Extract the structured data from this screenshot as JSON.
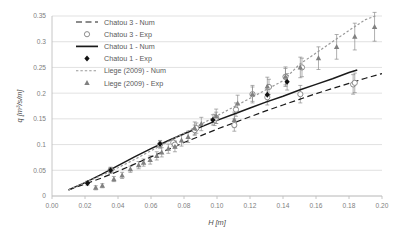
{
  "chart_data": {
    "type": "scatter",
    "title": "",
    "xlabel": "H [m]",
    "ylabel": "q [m³/s/m]",
    "xlim": [
      0.0,
      0.2
    ],
    "ylim": [
      0.0,
      0.35
    ],
    "xticks": [
      "0.00",
      "0.02",
      "0.04",
      "0.06",
      "0.08",
      "0.10",
      "0.12",
      "0.14",
      "0.16",
      "0.18",
      "0.20"
    ],
    "xtick_values": [
      0.0,
      0.02,
      0.04,
      0.06,
      0.08,
      0.1,
      0.12,
      0.14,
      0.16,
      0.18,
      0.2
    ],
    "yticks": [
      "0",
      "0.05",
      "0.1",
      "0.15",
      "0.2",
      "0.25",
      "0.3",
      "0.35"
    ],
    "ytick_values": [
      0,
      0.05,
      0.1,
      0.15,
      0.2,
      0.25,
      0.3,
      0.35
    ],
    "grid": "horizontal",
    "legend_position": "top-left-inside",
    "series": [
      {
        "name": "Chatou 3 - Num",
        "kind": "line",
        "style": "dashed",
        "color": "#1a1a1a",
        "x": [
          0.01,
          0.02,
          0.03,
          0.04,
          0.05,
          0.06,
          0.07,
          0.08,
          0.09,
          0.1,
          0.11,
          0.12,
          0.13,
          0.14,
          0.15,
          0.16,
          0.17,
          0.18,
          0.19,
          0.2
        ],
        "y": [
          0.012,
          0.023,
          0.035,
          0.048,
          0.062,
          0.076,
          0.09,
          0.104,
          0.117,
          0.13,
          0.142,
          0.154,
          0.166,
          0.177,
          0.188,
          0.199,
          0.209,
          0.219,
          0.229,
          0.238
        ]
      },
      {
        "name": "Chatou 3 - Exp",
        "kind": "marker",
        "marker": "open-circle",
        "color": "#808080",
        "x": [
          0.0355,
          0.0655,
          0.0735,
          0.0745,
          0.0865,
          0.0875,
          0.0985,
          0.0995,
          0.1105,
          0.1115,
          0.1215,
          0.1305,
          0.1315,
          0.1415,
          0.1505,
          0.1515,
          0.1825,
          0.1835
        ],
        "y": [
          0.05,
          0.1,
          0.104,
          0.1,
          0.128,
          0.132,
          0.148,
          0.152,
          0.138,
          0.168,
          0.198,
          0.192,
          0.212,
          0.232,
          0.198,
          0.25,
          0.217,
          0.22
        ],
        "yerr": [
          0.006,
          0.007,
          0.007,
          0.007,
          0.01,
          0.01,
          0.011,
          0.011,
          0.012,
          0.013,
          0.014,
          0.015,
          0.015,
          0.016,
          0.017,
          0.018,
          0.019,
          0.019
        ]
      },
      {
        "name": "Chatou 1 - Num",
        "kind": "line",
        "style": "solid",
        "color": "#1a1a1a",
        "x": [
          0.01,
          0.02,
          0.03,
          0.04,
          0.05,
          0.06,
          0.07,
          0.08,
          0.09,
          0.1,
          0.11,
          0.12,
          0.13,
          0.14,
          0.15,
          0.16,
          0.17,
          0.18,
          0.185
        ],
        "y": [
          0.012,
          0.026,
          0.042,
          0.059,
          0.076,
          0.092,
          0.107,
          0.121,
          0.134,
          0.147,
          0.159,
          0.171,
          0.183,
          0.194,
          0.206,
          0.217,
          0.228,
          0.24,
          0.245
        ]
      },
      {
        "name": "Chatou 1 - Exp",
        "kind": "marker",
        "marker": "filled-diamond",
        "color": "#111111",
        "x": [
          0.0215,
          0.0355,
          0.0655,
          0.0975,
          0.1305,
          0.1425
        ],
        "y": [
          0.025,
          0.05,
          0.101,
          0.148,
          0.197,
          0.222
        ],
        "yerr": [
          0.004,
          0.005,
          0.007,
          0.01,
          0.014,
          0.016
        ]
      },
      {
        "name": "Liege (2009) - Num",
        "kind": "line",
        "style": "dotted",
        "color": "#999999",
        "x": [
          0.01,
          0.02,
          0.03,
          0.04,
          0.05,
          0.06,
          0.07,
          0.08,
          0.09,
          0.1,
          0.11,
          0.12,
          0.13,
          0.14,
          0.15,
          0.16,
          0.17,
          0.18,
          0.19,
          0.196
        ],
        "y": [
          0.012,
          0.026,
          0.04,
          0.055,
          0.071,
          0.088,
          0.105,
          0.122,
          0.139,
          0.156,
          0.173,
          0.19,
          0.207,
          0.224,
          0.256,
          0.278,
          0.3,
          0.322,
          0.343,
          0.35
        ]
      },
      {
        "name": "Liege (2009) - Exp",
        "kind": "marker",
        "marker": "triangle",
        "color": "#808080",
        "x": [
          0.0265,
          0.0305,
          0.0375,
          0.0425,
          0.0475,
          0.0525,
          0.0555,
          0.0595,
          0.0635,
          0.0665,
          0.0705,
          0.0745,
          0.0785,
          0.0825,
          0.0865,
          0.0905,
          0.0995,
          0.1105,
          0.1125,
          0.1215,
          0.1305,
          0.1415,
          0.1505,
          0.1615,
          0.1725,
          0.1835,
          0.1955
        ],
        "y": [
          0.016,
          0.02,
          0.033,
          0.04,
          0.052,
          0.06,
          0.065,
          0.07,
          0.078,
          0.085,
          0.092,
          0.096,
          0.108,
          0.115,
          0.132,
          0.14,
          0.155,
          0.148,
          0.18,
          0.198,
          0.213,
          0.232,
          0.25,
          0.268,
          0.29,
          0.31,
          0.329
        ],
        "yerr": [
          0.004,
          0.004,
          0.005,
          0.006,
          0.006,
          0.007,
          0.007,
          0.008,
          0.008,
          0.009,
          0.009,
          0.01,
          0.011,
          0.011,
          0.012,
          0.013,
          0.014,
          0.015,
          0.016,
          0.017,
          0.018,
          0.019,
          0.02,
          0.022,
          0.024,
          0.026,
          0.028
        ]
      }
    ]
  },
  "legend": {
    "items": [
      {
        "label": "Chatou 3 - Num",
        "glyph": "dashed-line",
        "color": "#1a1a1a"
      },
      {
        "label": "Chatou 3 - Exp",
        "glyph": "open-circle",
        "color": "#808080"
      },
      {
        "label": "Chatou 1 - Num",
        "glyph": "solid-line",
        "color": "#1a1a1a"
      },
      {
        "label": "Chatou 1 - Exp",
        "glyph": "filled-diamond",
        "color": "#111111"
      },
      {
        "label": "Liege (2009) - Num",
        "glyph": "dotted-line",
        "color": "#999999"
      },
      {
        "label": "Liege (2009) - Exp",
        "glyph": "triangle",
        "color": "#808080"
      }
    ]
  },
  "style": {
    "background": "#ffffff",
    "grid_color": "#d9d9d9",
    "axis_color": "#bfbfbf",
    "tick_label_color": "#808080",
    "axis_title_color": "#4d4d4d"
  }
}
